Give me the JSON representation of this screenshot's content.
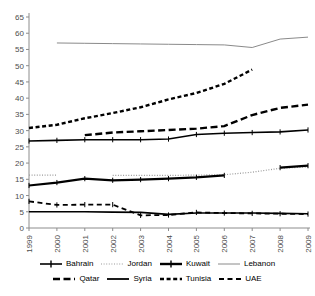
{
  "chart_data": {
    "type": "line",
    "title": "",
    "subtitle": "",
    "xlabel": "",
    "ylabel": "",
    "x": [
      1999,
      2000,
      2001,
      2002,
      2003,
      2004,
      2005,
      2006,
      2007,
      2008,
      2009
    ],
    "xtick_labels": [
      "1999",
      "2000",
      "2001",
      "2002",
      "2003",
      "2004",
      "2005",
      "2006",
      "2007",
      "2008",
      "2009"
    ],
    "ytick_labels": [
      "0",
      "5",
      "10",
      "15",
      "20",
      "25",
      "30",
      "35",
      "40",
      "45",
      "50",
      "55",
      "60",
      "65"
    ],
    "yticks": [
      0,
      5,
      10,
      15,
      20,
      25,
      30,
      35,
      40,
      45,
      50,
      55,
      60,
      65
    ],
    "ylim": [
      0,
      65
    ],
    "xlim": [
      1999,
      2009
    ],
    "grid": false,
    "legend_position": "bottom",
    "series": [
      {
        "name": "Bahrain",
        "style": "solid-marker",
        "color": "#000000",
        "width": 1.6,
        "markers": true,
        "values": [
          26.8,
          27.0,
          27.2,
          27.2,
          27.2,
          27.4,
          28.8,
          29.2,
          29.4,
          29.6,
          30.2
        ]
      },
      {
        "name": "Jordan",
        "style": "dotted",
        "color": "#9a9a9a",
        "width": 1.2,
        "markers": false,
        "values": [
          16.3,
          16.3,
          null,
          16.2,
          16.2,
          16.2,
          16.3,
          16.4,
          17.2,
          18.4,
          18.8
        ]
      },
      {
        "name": "Kuwait",
        "style": "solid-marker",
        "color": "#000000",
        "width": 2.2,
        "markers": true,
        "values": [
          13.1,
          14.0,
          15.2,
          14.7,
          14.9,
          15.2,
          15.6,
          16.2,
          null,
          18.6,
          19.2
        ]
      },
      {
        "name": "Lebanon",
        "style": "solid-thin",
        "color": "#8a8a8a",
        "width": 1.0,
        "markers": false,
        "values": [
          null,
          57.0,
          56.9,
          56.8,
          56.7,
          56.6,
          56.5,
          56.4,
          55.6,
          58.2,
          58.8
        ]
      },
      {
        "name": "Qatar",
        "style": "long-dash",
        "color": "#000000",
        "width": 2.4,
        "markers": false,
        "values": [
          null,
          null,
          28.6,
          29.4,
          29.8,
          30.2,
          30.6,
          31.4,
          34.8,
          37.0,
          38.0
        ]
      },
      {
        "name": "Syria",
        "style": "solid-medium",
        "color": "#000000",
        "width": 1.6,
        "markers": false,
        "values": [
          5.0,
          5.0,
          5.0,
          4.9,
          4.8,
          4.2,
          4.6,
          4.6,
          4.6,
          4.5,
          4.4
        ]
      },
      {
        "name": "Tunisia",
        "style": "short-dash",
        "color": "#000000",
        "width": 2.4,
        "markers": false,
        "values": [
          30.8,
          31.8,
          33.8,
          35.4,
          37.2,
          39.6,
          41.6,
          44.4,
          48.8,
          null,
          null
        ]
      },
      {
        "name": "UAE",
        "style": "dash",
        "color": "#000000",
        "width": 1.8,
        "markers": true,
        "values": [
          8.2,
          7.1,
          7.2,
          7.2,
          3.9,
          4.0,
          4.8,
          4.6,
          4.5,
          4.4,
          4.3
        ]
      }
    ]
  },
  "legend": {
    "rows": [
      [
        {
          "label": "Bahrain",
          "style": "solid-marker"
        },
        {
          "label": "Jordan",
          "style": "dotted"
        },
        {
          "label": "Kuwait",
          "style": "solid-marker-bold"
        },
        {
          "label": "Lebanon",
          "style": "solid-thin"
        }
      ],
      [
        {
          "label": "Qatar",
          "style": "long-dash"
        },
        {
          "label": "Syria",
          "style": "solid-medium"
        },
        {
          "label": "Tunisia",
          "style": "short-dash"
        },
        {
          "label": "UAE",
          "style": "dash"
        }
      ]
    ]
  },
  "axes": {
    "axis_color": "#8c8c8c",
    "tick_label_color": "#4d4d4d",
    "plot_background": "#ffffff"
  }
}
